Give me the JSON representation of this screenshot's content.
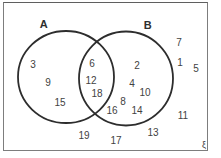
{
  "figure": {
    "type": "venn-diagram",
    "universal_set_symbol": "ξ",
    "set_a": {
      "label": "A",
      "members_only": [
        "3",
        "9",
        "15"
      ]
    },
    "set_b": {
      "label": "B",
      "members_only": [
        "2",
        "4",
        "10",
        "8",
        "16",
        "14"
      ]
    },
    "intersection": [
      "6",
      "12",
      "18"
    ],
    "outside": [
      "7",
      "1",
      "5",
      "11",
      "13",
      "19",
      "17"
    ],
    "colors": {
      "background": "#ffffff",
      "frame_border": "#7d7d7d",
      "circle_stroke": "#2d2d2d",
      "text": "#424242"
    },
    "numbers": [
      {
        "value": "3",
        "region": "a-only",
        "x": 33,
        "y": 64
      },
      {
        "value": "9",
        "region": "a-only",
        "x": 48,
        "y": 82
      },
      {
        "value": "15",
        "region": "a-only",
        "x": 60,
        "y": 102
      },
      {
        "value": "6",
        "region": "intersection",
        "x": 92,
        "y": 63
      },
      {
        "value": "12",
        "region": "intersection",
        "x": 91,
        "y": 80
      },
      {
        "value": "18",
        "region": "intersection",
        "x": 97,
        "y": 93
      },
      {
        "value": "2",
        "region": "b-only",
        "x": 137,
        "y": 65
      },
      {
        "value": "4",
        "region": "b-only",
        "x": 132,
        "y": 83
      },
      {
        "value": "10",
        "region": "b-only",
        "x": 145,
        "y": 92
      },
      {
        "value": "8",
        "region": "b-only",
        "x": 123,
        "y": 101
      },
      {
        "value": "16",
        "region": "b-only",
        "x": 112,
        "y": 110
      },
      {
        "value": "14",
        "region": "b-only",
        "x": 137,
        "y": 110
      },
      {
        "value": "7",
        "region": "outside",
        "x": 179,
        "y": 42
      },
      {
        "value": "1",
        "region": "outside",
        "x": 180,
        "y": 62
      },
      {
        "value": "5",
        "region": "outside",
        "x": 196,
        "y": 68
      },
      {
        "value": "11",
        "region": "outside",
        "x": 183,
        "y": 115
      },
      {
        "value": "13",
        "region": "outside",
        "x": 153,
        "y": 132
      },
      {
        "value": "19",
        "region": "outside",
        "x": 84,
        "y": 135
      },
      {
        "value": "17",
        "region": "outside",
        "x": 116,
        "y": 140
      }
    ],
    "geometry": {
      "circle_a": {
        "cx": 66,
        "cy": 77,
        "rx": 48,
        "ry": 46
      },
      "circle_b": {
        "cx": 126,
        "cy": 78.5,
        "rx": 47,
        "ry": 47
      }
    }
  }
}
